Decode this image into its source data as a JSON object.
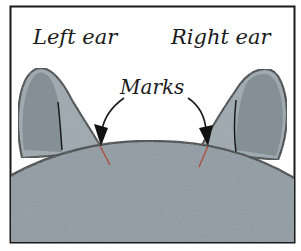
{
  "diagram": {
    "labels": {
      "left_ear": "Left ear",
      "right_ear": "Right ear",
      "marks": "Marks"
    },
    "colors": {
      "background": "#ffffff",
      "frame": "#1a1a1a",
      "head_fill": "#8a959c",
      "ear_outer": "#9aa4aa",
      "ear_inner": "#7e8990",
      "outline": "#1a1a1a",
      "mark": "#b04a3a"
    }
  }
}
